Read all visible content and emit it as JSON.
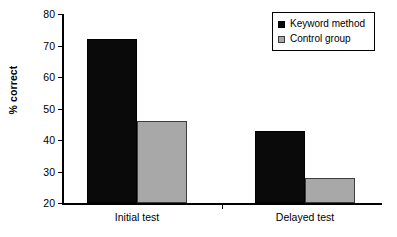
{
  "chart_data": {
    "type": "bar",
    "title": "",
    "xlabel": "",
    "ylabel": "% correct",
    "categories": [
      "Initial test",
      "Delayed test"
    ],
    "series": [
      {
        "name": "Keyword method",
        "values": [
          72,
          43
        ],
        "color": "#0a0a0a"
      },
      {
        "name": "Control group",
        "values": [
          46,
          28
        ],
        "color": "#a8a8a8"
      }
    ],
    "ylim": [
      20,
      80
    ],
    "ytick_values": [
      20,
      30,
      40,
      50,
      60,
      70,
      80
    ],
    "ytick_labels": [
      "20",
      "30",
      "40",
      "50",
      "60",
      "70",
      "80"
    ],
    "grid": false,
    "legend_position": "top-right"
  },
  "legend": {
    "items": [
      {
        "label": "Keyword method",
        "swatch": "black-square-swatch"
      },
      {
        "label": "Control group",
        "swatch": "gray-square-swatch"
      }
    ]
  },
  "axes": {
    "y_title": "% correct"
  }
}
